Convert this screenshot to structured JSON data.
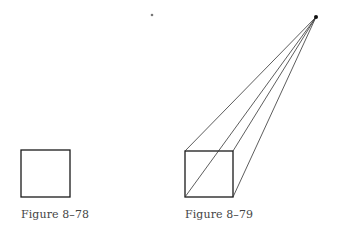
{
  "figures": [
    {
      "caption": "Figure 8–78",
      "square": {
        "x": 21,
        "y": 150,
        "w": 49,
        "h": 47
      }
    },
    {
      "caption": "Figure 8–79",
      "square": {
        "x": 185,
        "y": 151,
        "w": 48,
        "h": 46
      },
      "vanishing_point": {
        "x": 316,
        "y": 17
      },
      "projection_corners": [
        [
          185,
          151
        ],
        [
          233,
          151
        ],
        [
          233,
          197
        ],
        [
          185,
          197
        ]
      ]
    }
  ],
  "stray_dot": {
    "x": 152,
    "y": 15
  },
  "colors": {
    "line": "#1a1a1a",
    "caption": "#444444"
  }
}
